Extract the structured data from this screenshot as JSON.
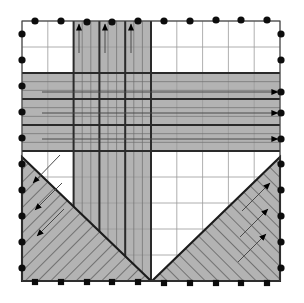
{
  "figure": {
    "kind": "mesh-boundary-condition-diagram",
    "width": 304,
    "height": 303,
    "background": "#ffffff"
  },
  "domain": {
    "x0": 22,
    "y0": 21,
    "x1": 280,
    "y1": 281,
    "outline_color": "#3f3f3f",
    "outline_width": 1.1
  },
  "grid": {
    "cols": 10,
    "rows": 10,
    "minor_color": "#9a9a9a",
    "minor_width": 0.8,
    "major_color": "#2a2a2a",
    "major_width": 2.0,
    "major_cols": [
      2,
      3,
      4,
      5
    ],
    "major_rows": [
      2,
      3,
      4,
      5
    ],
    "subdiv_color": "#6f6f6f",
    "subdiv_width": 0.7,
    "subdiv_cols": [
      2,
      3,
      4
    ],
    "subdiv_rows": [
      2,
      3,
      4
    ],
    "subdiv_count": 2
  },
  "shading": {
    "fill": "#b3b3b3",
    "fill_opacity": 1,
    "edge_color": "#2a2a2a",
    "edge_width": 2.0,
    "vertical_band": {
      "label": "vertical-load-band",
      "col_start": 2,
      "col_end": 5,
      "row_start": 0,
      "row_end": 10
    },
    "horizontal_band": {
      "label": "horizontal-load-band",
      "col_start": 0,
      "col_end": 10,
      "row_start": 2,
      "row_end": 5
    }
  },
  "hatched_regions": [
    {
      "label": "left-shear-triangle",
      "points": "22,157 22,281 151,281",
      "hatch_angle": 45,
      "hatch_color": "#3a3a3a",
      "hatch_spacing": 9,
      "fill": "#b3b3b3",
      "edge_color": "#1c1c1c",
      "edge_width": 2.1
    },
    {
      "label": "right-shear-triangle",
      "points": "280,157 280,281 152,281",
      "hatch_angle": -45,
      "hatch_color": "#3a3a3a",
      "hatch_spacing": 9,
      "fill": "#b3b3b3",
      "edge_color": "#1c1c1c",
      "edge_width": 2.1
    }
  ],
  "arrows": {
    "shaft_color": "#4a4a4a",
    "shaft_width": 1.0,
    "head_color": "#000000",
    "head_length": 7,
    "head_width": 5,
    "groups": [
      {
        "label": "top-upward-arrows",
        "direction": "up",
        "count": 3,
        "items": [
          {
            "x1": 79,
            "y1": 53,
            "x2": 79,
            "y2": 24
          },
          {
            "x1": 105,
            "y1": 53,
            "x2": 105,
            "y2": 24
          },
          {
            "x1": 131,
            "y1": 53,
            "x2": 131,
            "y2": 24
          }
        ]
      },
      {
        "label": "right-rightward-arrows",
        "direction": "right",
        "count": 3,
        "items": [
          {
            "x1": 42,
            "y1": 92,
            "x2": 278,
            "y2": 92
          },
          {
            "x1": 42,
            "y1": 113,
            "x2": 278,
            "y2": 113
          },
          {
            "x1": 42,
            "y1": 139,
            "x2": 278,
            "y2": 139
          }
        ]
      },
      {
        "label": "left-triangle-arrows",
        "direction": "down-left",
        "count": 3,
        "items": [
          {
            "x1": 60,
            "y1": 155,
            "x2": 33,
            "y2": 183
          },
          {
            "x1": 62,
            "y1": 183,
            "x2": 35,
            "y2": 210
          },
          {
            "x1": 64,
            "y1": 209,
            "x2": 37,
            "y2": 236
          }
        ]
      },
      {
        "label": "right-triangle-arrows",
        "direction": "up-right",
        "count": 3,
        "items": [
          {
            "x1": 242,
            "y1": 211,
            "x2": 270,
            "y2": 183
          },
          {
            "x1": 240,
            "y1": 237,
            "x2": 268,
            "y2": 209
          },
          {
            "x1": 238,
            "y1": 262,
            "x2": 266,
            "y2": 234
          }
        ]
      }
    ]
  },
  "markers": {
    "circle": {
      "label": "node-marker-circle",
      "color": "#0d0d0d",
      "radius": 3.6
    },
    "square": {
      "label": "node-marker-square",
      "color": "#0d0d0d",
      "size": 6.2
    },
    "top": [
      {
        "x": 35,
        "y": 21
      },
      {
        "x": 61,
        "y": 21
      },
      {
        "x": 87,
        "y": 22
      },
      {
        "x": 112,
        "y": 22
      },
      {
        "x": 138,
        "y": 21
      },
      {
        "x": 164,
        "y": 21
      },
      {
        "x": 190,
        "y": 21
      },
      {
        "x": 216,
        "y": 20
      },
      {
        "x": 241,
        "y": 20
      },
      {
        "x": 267,
        "y": 20
      }
    ],
    "left": [
      {
        "x": 22,
        "y": 34
      },
      {
        "x": 22,
        "y": 60
      },
      {
        "x": 22,
        "y": 86
      },
      {
        "x": 22,
        "y": 112
      },
      {
        "x": 22,
        "y": 138
      },
      {
        "x": 22,
        "y": 164
      },
      {
        "x": 22,
        "y": 190
      },
      {
        "x": 22,
        "y": 216
      },
      {
        "x": 22,
        "y": 242
      },
      {
        "x": 22,
        "y": 268
      }
    ],
    "right": [
      {
        "x": 281,
        "y": 34
      },
      {
        "x": 281,
        "y": 60
      },
      {
        "x": 281,
        "y": 92
      },
      {
        "x": 281,
        "y": 113
      },
      {
        "x": 281,
        "y": 139
      },
      {
        "x": 281,
        "y": 164
      },
      {
        "x": 281,
        "y": 190
      },
      {
        "x": 281,
        "y": 216
      },
      {
        "x": 281,
        "y": 242
      },
      {
        "x": 281,
        "y": 268
      }
    ],
    "bottom": [
      {
        "x": 35,
        "y": 282
      },
      {
        "x": 61,
        "y": 282
      },
      {
        "x": 87,
        "y": 282
      },
      {
        "x": 112,
        "y": 282
      },
      {
        "x": 138,
        "y": 282
      },
      {
        "x": 164,
        "y": 283
      },
      {
        "x": 190,
        "y": 283
      },
      {
        "x": 216,
        "y": 283
      },
      {
        "x": 241,
        "y": 283
      },
      {
        "x": 267,
        "y": 283
      }
    ]
  }
}
